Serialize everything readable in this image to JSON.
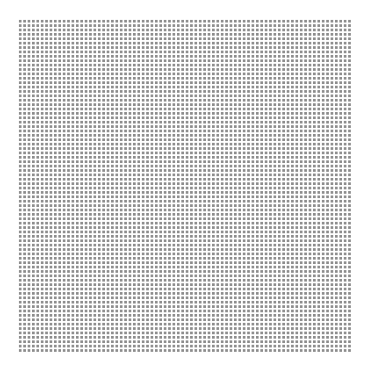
{
  "pattern": {
    "type": "dot-grid",
    "columns": 76,
    "rows": 76,
    "pitch_px": 4.4,
    "dot_color": "#8c8c8c",
    "background_color": "#ffffff"
  }
}
